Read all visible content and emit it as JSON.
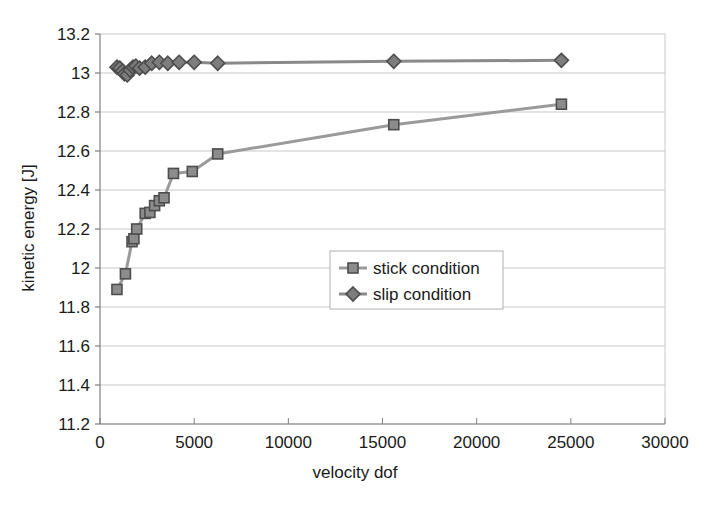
{
  "chart_data": {
    "type": "scatter",
    "title": "",
    "xlabel": "velocity dof",
    "ylabel": "kinetic energy [J]",
    "xlim": [
      0,
      30000
    ],
    "ylim": [
      11.2,
      13.2
    ],
    "xticks": [
      0,
      5000,
      10000,
      15000,
      20000,
      25000,
      30000
    ],
    "xtick_labels": [
      "0",
      "5000",
      "10000",
      "15000",
      "20000",
      "25000",
      "30000"
    ],
    "yticks": [
      11.2,
      11.4,
      11.6,
      11.8,
      12,
      12.2,
      12.4,
      12.6,
      12.8,
      13,
      13.2
    ],
    "ytick_labels": [
      "11.2",
      "11.4",
      "11.6",
      "11.8",
      "12",
      "12.2",
      "12.4",
      "12.6",
      "12.8",
      "13",
      "13.2"
    ],
    "grid": "horizontal",
    "legend_position": "center-right-inside",
    "series": [
      {
        "name": "stick condition",
        "marker": "square",
        "color": "#8c8c8c",
        "line_color": "#9a9a9a",
        "marker_edge": "#4d4d4d",
        "points": [
          {
            "x": 900,
            "y": 11.89
          },
          {
            "x": 1350,
            "y": 11.97
          },
          {
            "x": 1700,
            "y": 12.135
          },
          {
            "x": 1800,
            "y": 12.15
          },
          {
            "x": 1950,
            "y": 12.2
          },
          {
            "x": 2400,
            "y": 12.28
          },
          {
            "x": 2650,
            "y": 12.285
          },
          {
            "x": 2900,
            "y": 12.32
          },
          {
            "x": 3150,
            "y": 12.345
          },
          {
            "x": 3400,
            "y": 12.36
          },
          {
            "x": 3900,
            "y": 12.485
          },
          {
            "x": 4900,
            "y": 12.495
          },
          {
            "x": 6250,
            "y": 12.585
          },
          {
            "x": 15600,
            "y": 12.735
          },
          {
            "x": 24500,
            "y": 12.84
          }
        ]
      },
      {
        "name": "slip condition",
        "marker": "diamond",
        "color": "#7d7d7d",
        "line_color": "#8a8a8a",
        "marker_edge": "#4d4d4d",
        "points": [
          {
            "x": 900,
            "y": 13.03
          },
          {
            "x": 1050,
            "y": 13.025
          },
          {
            "x": 1200,
            "y": 13.01
          },
          {
            "x": 1300,
            "y": 12.995
          },
          {
            "x": 1450,
            "y": 12.99
          },
          {
            "x": 1600,
            "y": 13.015
          },
          {
            "x": 1750,
            "y": 13.03
          },
          {
            "x": 1900,
            "y": 13.035
          },
          {
            "x": 2100,
            "y": 13.025
          },
          {
            "x": 2400,
            "y": 13.03
          },
          {
            "x": 2750,
            "y": 13.05
          },
          {
            "x": 3150,
            "y": 13.055
          },
          {
            "x": 3600,
            "y": 13.05
          },
          {
            "x": 4200,
            "y": 13.055
          },
          {
            "x": 5000,
            "y": 13.055
          },
          {
            "x": 6250,
            "y": 13.05
          },
          {
            "x": 15600,
            "y": 13.06
          },
          {
            "x": 24500,
            "y": 13.065
          }
        ]
      }
    ]
  },
  "legend": {
    "items": [
      {
        "label": "stick condition",
        "marker": "square"
      },
      {
        "label": "slip condition",
        "marker": "diamond"
      }
    ]
  },
  "colors": {
    "grid": "#c9c9c9",
    "axis": "#808080",
    "text": "#1a1a1a",
    "stick": "#8c8c8c",
    "slip": "#7d7d7d",
    "legend_border": "#b0b0b0",
    "background": "#ffffff"
  }
}
